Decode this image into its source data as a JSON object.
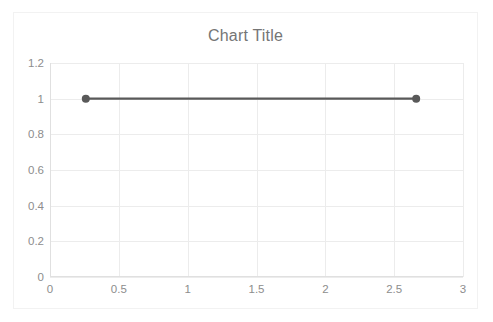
{
  "chart_data": {
    "type": "line",
    "title": "Chart Title",
    "xlabel": "",
    "ylabel": "",
    "xlim": [
      0,
      3
    ],
    "ylim": [
      0,
      1.2
    ],
    "grid": true,
    "legend": "none",
    "x_ticks": [
      "0",
      "0.5",
      "1",
      "1.5",
      "2",
      "2.5",
      "3"
    ],
    "x_tick_values": [
      0,
      0.5,
      1,
      1.5,
      2,
      2.5,
      3
    ],
    "y_ticks": [
      "0",
      "0.2",
      "0.4",
      "0.6",
      "0.8",
      "1",
      "1.2"
    ],
    "y_tick_values": [
      0,
      0.2,
      0.4,
      0.6,
      0.8,
      1,
      1.2
    ],
    "series": [
      {
        "name": "Series 1",
        "color": "#595959",
        "marker": "circle",
        "marker_color": "#595959",
        "x": [
          0.26,
          2.66
        ],
        "y": [
          1,
          1
        ]
      }
    ]
  },
  "style": {
    "background": "#ffffff",
    "card_border": "#f2f2f2",
    "grid_color": "#ececec",
    "axis_color": "#e0e0e0",
    "title_color": "#757575",
    "tick_color": "#8d8d8d"
  }
}
